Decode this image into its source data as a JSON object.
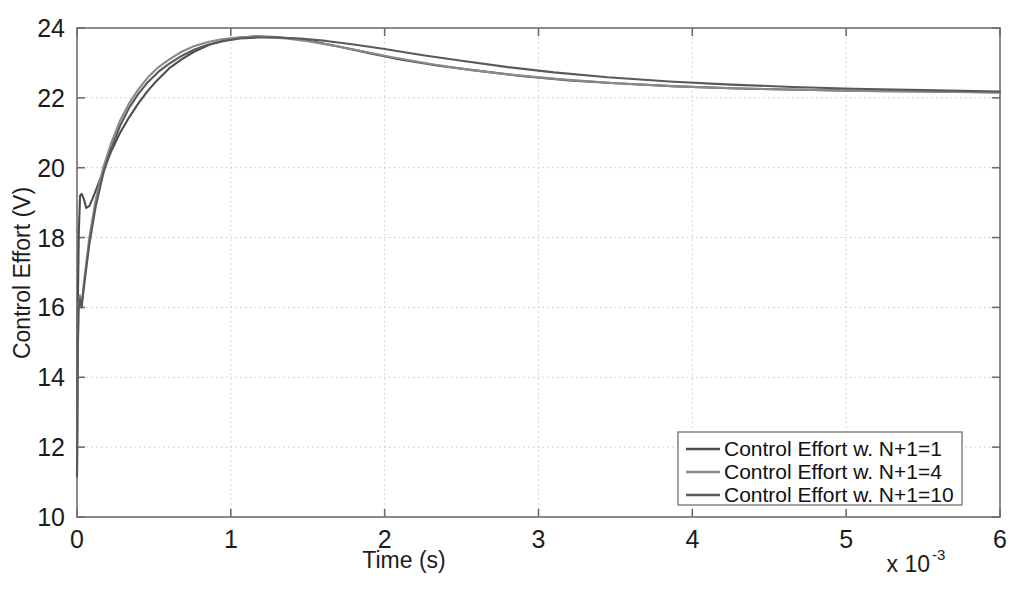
{
  "chart_data": {
    "type": "line",
    "title": "",
    "xlabel": "Time (s)",
    "ylabel": "Control Effort (V)",
    "x_multiplier": "x 10",
    "x_multiplier_exponent": "-3",
    "x_multiplier_full": "x 10^-3",
    "xlim": [
      0,
      6
    ],
    "ylim": [
      10,
      24
    ],
    "xticks": [
      0,
      1,
      2,
      3,
      4,
      5,
      6
    ],
    "xtick_labels": [
      "0",
      "1",
      "2",
      "3",
      "4",
      "5",
      "6"
    ],
    "yticks": [
      10,
      12,
      14,
      16,
      18,
      20,
      22,
      24
    ],
    "ytick_labels": [
      "10",
      "12",
      "14",
      "16",
      "18",
      "20",
      "22",
      "24"
    ],
    "grid": true,
    "legend_position": "lower right",
    "series": [
      {
        "name": "Control Effort w. N+1=1",
        "color": "#4d4d4d",
        "x": [
          0.0,
          0.005,
          0.012,
          0.02,
          0.03,
          0.045,
          0.06,
          0.08,
          0.1,
          0.14,
          0.18,
          0.22,
          0.28,
          0.34,
          0.4,
          0.46,
          0.52,
          0.6,
          0.68,
          0.76,
          0.86,
          0.96,
          1.06,
          1.16,
          1.26,
          1.4,
          1.55,
          1.7,
          1.9,
          2.1,
          2.35,
          2.6,
          2.9,
          3.2,
          3.5,
          3.9,
          4.3,
          4.7,
          5.1,
          5.5,
          6.0
        ],
        "y": [
          11.2,
          16.0,
          18.2,
          19.2,
          19.25,
          19.1,
          18.85,
          18.9,
          19.1,
          19.55,
          20.0,
          20.45,
          21.0,
          21.45,
          21.85,
          22.2,
          22.5,
          22.85,
          23.1,
          23.32,
          23.52,
          23.65,
          23.73,
          23.76,
          23.75,
          23.7,
          23.6,
          23.47,
          23.28,
          23.1,
          22.92,
          22.78,
          22.62,
          22.5,
          22.42,
          22.33,
          22.27,
          22.23,
          22.2,
          22.18,
          22.16
        ]
      },
      {
        "name": "Control Effort w. N+1=4",
        "color": "#8a8a8a",
        "x": [
          0.0,
          0.004,
          0.01,
          0.018,
          0.03,
          0.05,
          0.08,
          0.12,
          0.17,
          0.22,
          0.28,
          0.34,
          0.4,
          0.46,
          0.53,
          0.6,
          0.68,
          0.76,
          0.85,
          0.94,
          1.04,
          1.14,
          1.24,
          1.36,
          1.5,
          1.66,
          1.84,
          2.05,
          2.3,
          2.55,
          2.85,
          3.15,
          3.5,
          3.9,
          4.3,
          4.7,
          5.1,
          5.5,
          6.0
        ],
        "y": [
          11.3,
          14.6,
          16.1,
          16.35,
          16.1,
          16.9,
          18.0,
          19.05,
          20.0,
          20.68,
          21.35,
          21.85,
          22.25,
          22.58,
          22.88,
          23.1,
          23.32,
          23.48,
          23.6,
          23.68,
          23.73,
          23.75,
          23.74,
          23.7,
          23.62,
          23.5,
          23.35,
          23.16,
          22.97,
          22.8,
          22.65,
          22.53,
          22.42,
          22.33,
          22.27,
          22.23,
          22.2,
          22.18,
          22.15
        ]
      },
      {
        "name": "Control Effort w. N+1=10",
        "color": "#595959",
        "x": [
          0.0,
          0.004,
          0.01,
          0.018,
          0.03,
          0.05,
          0.08,
          0.12,
          0.17,
          0.22,
          0.28,
          0.34,
          0.4,
          0.46,
          0.53,
          0.6,
          0.68,
          0.76,
          0.85,
          0.95,
          1.06,
          1.18,
          1.3,
          1.45,
          1.62,
          1.8,
          2.0,
          2.25,
          2.5,
          2.8,
          3.1,
          3.45,
          3.85,
          4.25,
          4.65,
          5.05,
          5.5,
          6.0
        ],
        "y": [
          11.15,
          14.4,
          15.9,
          16.25,
          16.0,
          16.75,
          17.8,
          18.85,
          19.82,
          20.52,
          21.2,
          21.72,
          22.12,
          22.45,
          22.75,
          22.98,
          23.2,
          23.38,
          23.52,
          23.62,
          23.7,
          23.73,
          23.73,
          23.7,
          23.63,
          23.53,
          23.4,
          23.22,
          23.06,
          22.88,
          22.73,
          22.59,
          22.47,
          22.38,
          22.31,
          22.26,
          22.22,
          22.18
        ]
      }
    ],
    "legend_entries": [
      {
        "label": "Control Effort w. N+1=1",
        "color": "#4d4d4d"
      },
      {
        "label": "Control Effort w. N+1=4",
        "color": "#8a8a8a"
      },
      {
        "label": "Control Effort w. N+1=10",
        "color": "#595959"
      }
    ],
    "colors": {
      "axis": "#6e6e6e",
      "grid": "#c9c9c9",
      "text": "#1c1c1c",
      "background": "#ffffff"
    }
  }
}
